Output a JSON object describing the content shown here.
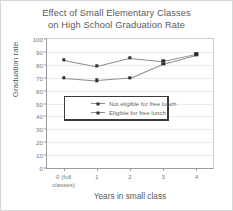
{
  "chart_data": {
    "type": "line",
    "title": "Effect of Small Elementary Classes on High School Graduation Rate",
    "title_line1": "Effect of Small Elementary Classes",
    "title_line2": "on High School Graduation Rate",
    "xlabel": "Years in small class",
    "ylabel": "Graduation rate",
    "categories": [
      "0 (full classes)",
      "1",
      "2",
      "3",
      "4"
    ],
    "category_labels": [
      "0 (full\nclasses)",
      "1",
      "2",
      "3",
      "4"
    ],
    "ylim": [
      0,
      100
    ],
    "yticks": [
      0,
      10,
      20,
      30,
      40,
      50,
      60,
      70,
      80,
      90,
      100
    ],
    "ytick_labels": [
      "0",
      "10",
      "20",
      "30",
      "40",
      "50",
      "60",
      "70",
      "80",
      "90",
      "100"
    ],
    "grid": true,
    "legend_position": "center",
    "marker": "square",
    "series": [
      {
        "name": "Not eligible for free lunch",
        "values": [
          84,
          79,
          85.5,
          83,
          88.5
        ],
        "color": "#2f2f2f"
      },
      {
        "name": "Eligible for free lunch",
        "values": [
          70,
          68,
          70,
          81,
          88
        ],
        "color": "#2f2f2f"
      }
    ]
  },
  "colors": {
    "line": "#8e8e8e",
    "marker": "#2f2f2f",
    "grid": "#ececec",
    "axis": "#9a9a9a",
    "text": "#5a5a5a",
    "tick_text": "#777777",
    "legend_border": "#3a3a3a",
    "page_border": "#d8d8d8",
    "background": "#ffffff"
  }
}
